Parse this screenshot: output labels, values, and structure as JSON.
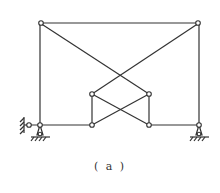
{
  "figure": {
    "caption": "( a )",
    "stroke_color": "#333333",
    "nodes": {
      "top_left": [
        40,
        23
      ],
      "top_right": [
        199,
        23
      ],
      "bottom_left": [
        40,
        125
      ],
      "bottom_right": [
        199,
        125
      ],
      "inner_top_left": [
        92,
        94
      ],
      "inner_top_right": [
        149,
        94
      ],
      "inner_bottom_left": [
        92,
        125
      ],
      "inner_bottom_right": [
        149,
        125
      ],
      "wall_hinge": [
        29,
        125
      ]
    },
    "supports": [
      {
        "type": "pin",
        "at": "bottom_left"
      },
      {
        "type": "pin",
        "at": "bottom_right"
      },
      {
        "type": "wall-link",
        "at": "wall_hinge"
      }
    ]
  }
}
